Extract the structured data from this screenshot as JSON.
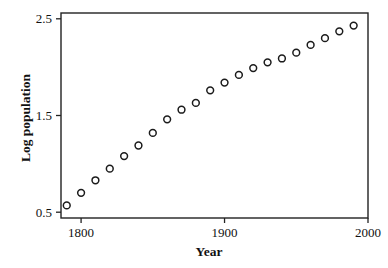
{
  "chart_data": {
    "type": "scatter",
    "title": "",
    "xlabel": "Year",
    "ylabel": "Log population",
    "xlim": [
      1786,
      2000
    ],
    "ylim": [
      0.44,
      2.56
    ],
    "xticks": [
      1800,
      1900,
      2000
    ],
    "xtick_labels": [
      "1800",
      "1900",
      "2000"
    ],
    "yticks": [
      0.5,
      1.5,
      2.5
    ],
    "ytick_labels": [
      "0.5",
      "1.5",
      "2.5"
    ],
    "grid": false,
    "legend": null,
    "marker": "open-circle",
    "marker_color": "#1b1b1b",
    "x": [
      1790,
      1800,
      1810,
      1820,
      1830,
      1840,
      1850,
      1860,
      1870,
      1880,
      1890,
      1900,
      1910,
      1920,
      1930,
      1940,
      1950,
      1960,
      1970,
      1980,
      1990
    ],
    "y": [
      0.57,
      0.7,
      0.83,
      0.95,
      1.08,
      1.19,
      1.32,
      1.46,
      1.56,
      1.63,
      1.76,
      1.84,
      1.92,
      1.99,
      2.05,
      2.09,
      2.15,
      2.23,
      2.3,
      2.37,
      2.43
    ],
    "points": [
      {
        "year": 1790,
        "log_population": 0.57,
        "px": 72,
        "py": 206
      },
      {
        "year": 1800,
        "log_population": 0.7,
        "px": 86,
        "py": 193
      },
      {
        "year": 1810,
        "log_population": 0.83,
        "px": 99,
        "py": 180
      },
      {
        "year": 1820,
        "log_population": 0.95,
        "px": 112,
        "py": 168
      },
      {
        "year": 1830,
        "log_population": 1.08,
        "px": 126,
        "py": 155
      },
      {
        "year": 1840,
        "log_population": 1.19,
        "px": 140,
        "py": 144
      },
      {
        "year": 1850,
        "log_population": 1.32,
        "px": 153,
        "py": 132
      },
      {
        "year": 1860,
        "log_population": 1.46,
        "px": 167,
        "py": 118
      },
      {
        "year": 1870,
        "log_population": 1.56,
        "px": 181,
        "py": 108
      },
      {
        "year": 1880,
        "log_population": 1.63,
        "px": 194,
        "py": 101
      },
      {
        "year": 1890,
        "log_population": 1.76,
        "px": 208,
        "py": 92
      },
      {
        "year": 1900,
        "log_population": 1.84,
        "px": 222,
        "py": 84
      },
      {
        "year": 1910,
        "log_population": 1.92,
        "px": 236,
        "py": 77
      },
      {
        "year": 1920,
        "log_population": 1.99,
        "px": 249,
        "py": 70
      },
      {
        "year": 1930,
        "log_population": 2.05,
        "px": 263,
        "py": 63
      },
      {
        "year": 1940,
        "log_population": 2.09,
        "px": 276,
        "py": 59
      },
      {
        "year": 1950,
        "log_population": 2.15,
        "px": 290,
        "py": 53
      },
      {
        "year": 1960,
        "log_population": 2.23,
        "px": 304,
        "py": 46
      },
      {
        "year": 1970,
        "log_population": 2.3,
        "px": 317,
        "py": 39
      },
      {
        "year": 1980,
        "log_population": 2.37,
        "px": 331,
        "py": 32
      },
      {
        "year": 1990,
        "log_population": 2.43,
        "px": 345,
        "py": 27
      }
    ]
  },
  "axes": {
    "x_title": "Year",
    "y_title": "Log population"
  },
  "frame": {
    "left": 61,
    "right": 368,
    "top": 13,
    "bottom": 218
  }
}
